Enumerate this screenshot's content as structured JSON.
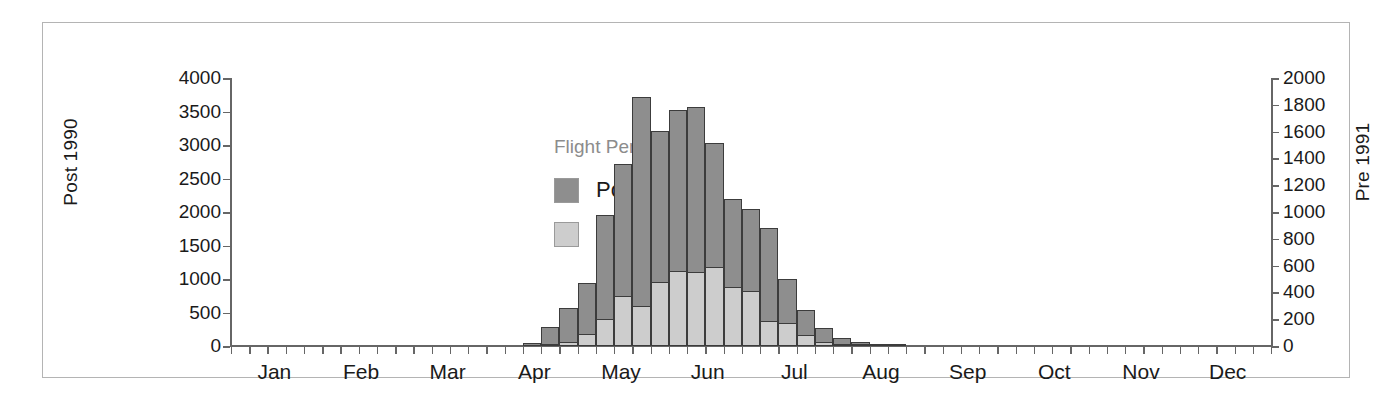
{
  "figure": {
    "background": "#ffffff",
    "frame_color": "#b4b4b4"
  },
  "legend": {
    "title": "Flight Period",
    "entries": [
      {
        "label": "Post 1990",
        "color": "#8e8e8e"
      },
      {
        "label": "Pre 1991",
        "color": "#cdcdcd"
      }
    ]
  },
  "chart_data": {
    "type": "bar",
    "title": "",
    "subtitle": "",
    "xlabel": "",
    "ylabel": "Post 1990",
    "y2label": "Pre 1991",
    "grid": false,
    "legend_position": "inside-upper-left",
    "legend_title": "Flight Period",
    "bar_style": "overlapping dual-axis weekly histogram",
    "xlim_months": [
      "Jan",
      "Dec"
    ],
    "x_tick_interval": "weekly (approx. 4-5 ticks per month)",
    "x_tick_count": 57,
    "xtick_labels": [
      "Jan",
      "Feb",
      "Mar",
      "Apr",
      "May",
      "Jun",
      "Jul",
      "Aug",
      "Sep",
      "Oct",
      "Nov",
      "Dec"
    ],
    "ylim": [
      0,
      4000
    ],
    "ytick_labels": [
      "0",
      "500",
      "1000",
      "1500",
      "2000",
      "2500",
      "3000",
      "3500",
      "4000"
    ],
    "yticks": [
      0,
      500,
      1000,
      1500,
      2000,
      2500,
      3000,
      3500,
      4000
    ],
    "y2lim": [
      0,
      2000
    ],
    "y2tick_labels": [
      "0",
      "200",
      "400",
      "600",
      "800",
      "1000",
      "1200",
      "1400",
      "1600",
      "1800",
      "2000"
    ],
    "y2ticks": [
      0,
      200,
      400,
      600,
      800,
      1000,
      1200,
      1400,
      1600,
      1800,
      2000
    ],
    "categories": [
      "wk1",
      "wk2",
      "wk3",
      "wk4",
      "wk5",
      "wk6",
      "wk7",
      "wk8",
      "wk9",
      "wk10",
      "wk11",
      "wk12",
      "wk13",
      "wk14",
      "wk15",
      "wk16",
      "wk17",
      "wk18",
      "wk19",
      "wk20",
      "wk21",
      "wk22",
      "wk23",
      "wk24",
      "wk25",
      "wk26",
      "wk27",
      "wk28",
      "wk29",
      "wk30",
      "wk31",
      "wk32",
      "wk33",
      "wk34",
      "wk35",
      "wk36",
      "wk37",
      "wk38",
      "wk39",
      "wk40",
      "wk41",
      "wk42",
      "wk43",
      "wk44",
      "wk45",
      "wk46",
      "wk47",
      "wk48",
      "wk49",
      "wk50",
      "wk51",
      "wk52",
      "wk53",
      "wk54",
      "wk55",
      "wk56",
      "wk57"
    ],
    "series": [
      {
        "name": "Post 1990",
        "axis": "left",
        "color": "#8e8e8e",
        "values": [
          0,
          0,
          0,
          0,
          0,
          0,
          0,
          0,
          0,
          0,
          0,
          0,
          0,
          0,
          0,
          0,
          40,
          290,
          570,
          940,
          1950,
          2720,
          3720,
          3210,
          3520,
          3570,
          3030,
          2190,
          2050,
          1760,
          1000,
          540,
          270,
          120,
          60,
          30,
          10,
          0,
          0,
          0,
          0,
          0,
          0,
          0,
          0,
          0,
          0,
          0,
          0,
          0,
          0,
          0,
          0,
          0,
          0,
          0,
          0
        ]
      },
      {
        "name": "Pre 1991",
        "axis": "right",
        "color": "#cdcdcd",
        "values": [
          0,
          0,
          0,
          0,
          0,
          0,
          0,
          0,
          0,
          0,
          0,
          0,
          0,
          0,
          0,
          0,
          0,
          10,
          30,
          90,
          200,
          370,
          300,
          480,
          560,
          550,
          590,
          440,
          410,
          190,
          175,
          80,
          30,
          15,
          5,
          0,
          0,
          0,
          0,
          0,
          0,
          0,
          0,
          0,
          0,
          0,
          0,
          0,
          0,
          0,
          0,
          0,
          0,
          0,
          0,
          0,
          0
        ]
      }
    ]
  }
}
